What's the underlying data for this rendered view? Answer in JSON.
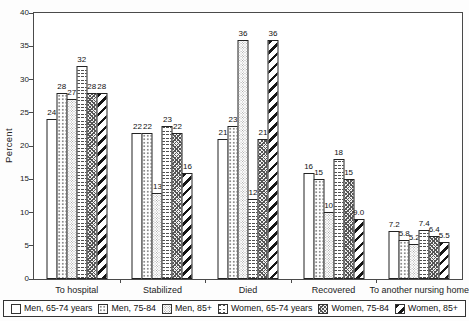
{
  "chart_data": {
    "type": "bar",
    "title": "",
    "xlabel": "",
    "ylabel": "Percent",
    "ylim": [
      0,
      40
    ],
    "yticks": [
      0,
      5,
      10,
      15,
      20,
      25,
      30,
      35,
      40
    ],
    "grid": false,
    "legend_position": "bottom",
    "categories": [
      "To hospital",
      "Stabilized",
      "Died",
      "Recovered",
      "To another nursing home"
    ],
    "series": [
      {
        "name": "Men, 65-74 years",
        "pattern": "plain",
        "values": [
          24,
          22,
          21,
          16,
          7.2
        ],
        "labels": [
          "24",
          "22",
          "21",
          "16",
          "7.2"
        ]
      },
      {
        "name": "Men, 75-84",
        "pattern": "dots",
        "values": [
          28,
          22,
          23,
          15,
          5.8
        ],
        "labels": [
          "28",
          "22",
          "23",
          "15",
          "5.8"
        ]
      },
      {
        "name": "Men, 85+",
        "pattern": "stipple",
        "values": [
          27,
          13,
          36,
          10,
          5.2
        ],
        "labels": [
          "27",
          "13",
          "36",
          "10",
          "5.2"
        ]
      },
      {
        "name": "Women, 65-74 years",
        "pattern": "zigzag",
        "values": [
          32,
          23,
          12,
          18,
          7.4
        ],
        "labels": [
          "32",
          "23",
          "12",
          "18",
          "7.4"
        ]
      },
      {
        "name": "Women, 75-84",
        "pattern": "crosshatch",
        "values": [
          28,
          22,
          21,
          15,
          6.4
        ],
        "labels": [
          "28",
          "22",
          "21",
          "15",
          "6.4"
        ]
      },
      {
        "name": "Women, 85+",
        "pattern": "diagonal-stripes",
        "values": [
          28,
          16,
          36,
          9.0,
          5.5
        ],
        "labels": [
          "28",
          "16",
          "36",
          "9.0",
          "5.5"
        ]
      }
    ]
  },
  "colors": {
    "axis": "#4a4a4a",
    "bar_border": "#222222",
    "pattern_dark": "#161616",
    "pattern_gray": "#9a9a9a"
  }
}
